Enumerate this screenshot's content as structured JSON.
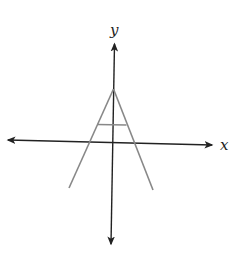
{
  "diagram": {
    "type": "coordinate-plane-figure",
    "axes": {
      "x_label": "x",
      "y_label": "y",
      "x_axis_color": "#222222",
      "y_axis_color": "#222222",
      "arrows": [
        "left",
        "right",
        "up",
        "down"
      ]
    },
    "figure": {
      "shape": "letter-A",
      "line_color": "#888888",
      "apex_on": "positive y-axis",
      "crossbar": "horizontal segment between legs, above x-axis",
      "legs_extend_below": "x-axis"
    }
  }
}
